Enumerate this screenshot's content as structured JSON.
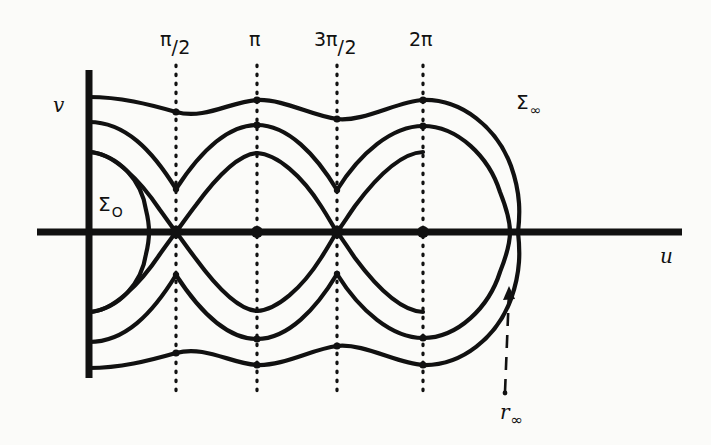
{
  "figure": {
    "background_color": "#fbfbf9",
    "ink_color": "#111111",
    "axes": {
      "horizontal_label": "u",
      "vertical_label": "v",
      "origin": {
        "x": 89,
        "y": 232
      },
      "horizontal_extent": [
        37,
        682
      ],
      "vertical_extent": [
        70,
        378
      ]
    },
    "tick_labels": [
      {
        "id": "pi-over-2",
        "numerator": "π",
        "separator": "/",
        "denominator": "2",
        "x": 176
      },
      {
        "id": "pi",
        "numerator": "π",
        "separator": "",
        "denominator": "",
        "x": 257
      },
      {
        "id": "three-pi-over-2",
        "numerator": "3π",
        "separator": "/",
        "denominator": "2",
        "x": 337
      },
      {
        "id": "two-pi",
        "numerator": "2π",
        "separator": "",
        "denominator": "",
        "x": 423
      }
    ],
    "curve_labels": [
      {
        "id": "sigma-zero",
        "base": "Σ",
        "sub": "O",
        "x": 98,
        "y": 194
      },
      {
        "id": "sigma-infinity",
        "base": "Σ",
        "sub": "∞",
        "x": 516,
        "y": 92
      },
      {
        "id": "r-infinity",
        "base": "r",
        "sub": "∞",
        "x": 500,
        "y": 402
      }
    ],
    "nodes": [
      {
        "x": 176,
        "y": 232,
        "kind": "saddle-crossing"
      },
      {
        "x": 257,
        "y": 232,
        "kind": "center-dot"
      },
      {
        "x": 337,
        "y": 232,
        "kind": "saddle-crossing"
      },
      {
        "x": 423,
        "y": 232,
        "kind": "center-dot"
      }
    ],
    "dotted_guides": {
      "x_positions": [
        176,
        257,
        337,
        423
      ],
      "y_top": 65,
      "y_bottom": 392
    },
    "arrow": {
      "id": "r-infinity-arrow",
      "from": {
        "x": 505,
        "y": 392
      },
      "to": {
        "x": 509,
        "y": 288
      },
      "style": "dashed-with-arrowhead"
    },
    "curves": [
      {
        "id": "sigma-infinity-outer",
        "description": "outermost closed wavy contour, crosses u-axis near u=518"
      },
      {
        "id": "middle-wavy-contour",
        "description": "second wavy contour, crosses u-axis near u=510"
      },
      {
        "id": "separatrix-upper",
        "description": "separatrix arcs meeting at saddle points on the u-axis"
      },
      {
        "id": "sigma-zero-inner",
        "description": "small innermost lens-shaped curve next to the v-axis"
      }
    ]
  }
}
